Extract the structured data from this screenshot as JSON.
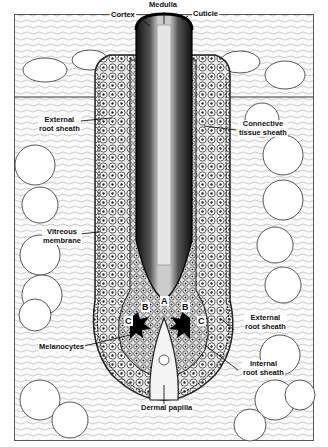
{
  "diagram": {
    "labels": {
      "medulla": "Medulla",
      "cortex": "Cortex",
      "cuticle": "Cuticle",
      "external_root_sheath_top": "External\nroot sheath",
      "connective_tissue_sheath": "Connective\ntissue sheath",
      "vitreous_membrane": "Vitreous\nmembrane",
      "external_root_sheath_bottom": "External\nroot sheath",
      "internal_root_sheath": "Internal\nroot sheath",
      "melanocytes": "Melanocytes",
      "dermal_papilla": "Dermal papilla"
    },
    "region_letters": {
      "a": "A",
      "b_left": "B",
      "b_right": "B",
      "c_left": "C",
      "c_right": "C"
    }
  }
}
